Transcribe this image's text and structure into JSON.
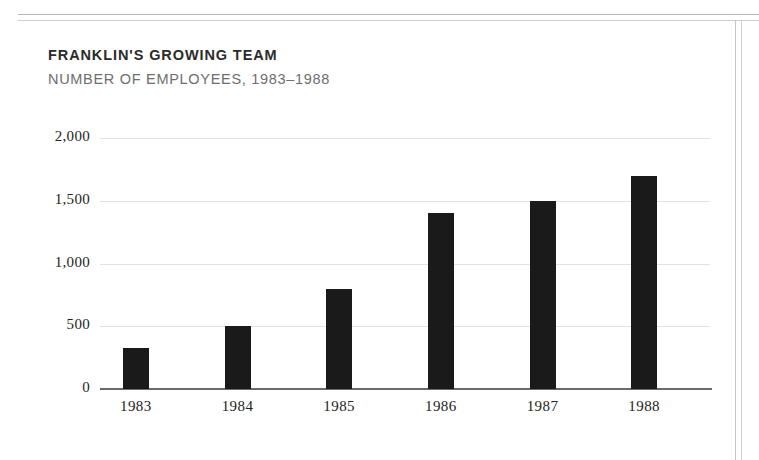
{
  "page": {
    "title": "FRANKLIN'S GROWING TEAM",
    "subtitle": "NUMBER OF EMPLOYEES, 1983–1988"
  },
  "chart_data": {
    "type": "bar",
    "title": "FRANKLIN'S GROWING TEAM",
    "subtitle": "NUMBER OF EMPLOYEES, 1983–1988",
    "xlabel": "",
    "ylabel": "",
    "categories": [
      "1983",
      "1984",
      "1985",
      "1986",
      "1987",
      "1988"
    ],
    "values": [
      325,
      500,
      800,
      1400,
      1500,
      1700
    ],
    "ylim": [
      0,
      2000
    ],
    "yticks": [
      0,
      500,
      1000,
      1500,
      2000
    ],
    "ytick_labels": [
      "0",
      "500",
      "1,000",
      "1,500",
      "2,000"
    ],
    "grid": true,
    "legend": "none",
    "bar_color": "#1a1a1a",
    "gridline_color": "#e2e2e2",
    "axis_color": "#6a6a6a"
  },
  "colors": {
    "title_text": "#2b2b2b",
    "subtitle_text": "#6e6e6e",
    "tick_text": "#232323",
    "page_background": "#ffffff",
    "rule": "#b9b9b9"
  }
}
